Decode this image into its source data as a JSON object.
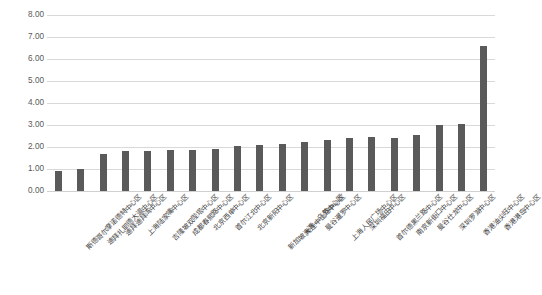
{
  "chart_data": {
    "type": "bar",
    "title": "",
    "subtitle": "",
    "xlabel": "",
    "ylabel": "",
    "ylim": [
      0,
      8
    ],
    "ytick_step": 1,
    "grid": true,
    "legend": "none",
    "bar_color": "#5a5a5a",
    "gridline_color": "#d9d9d9",
    "axis_text_color": "#595959",
    "ytick_labels": [
      "0.00",
      "1.00",
      "2.00",
      "3.00",
      "4.00",
      "5.00",
      "6.00",
      "7.00",
      "8.00"
    ],
    "categories": [
      "斯德哥尔摩诺德特中心区",
      "迪拜扎耶德大道中心区",
      "迪拜迪拜湾中心区",
      "上海陆家嘴中心区",
      "吉隆坡双陛塔中心区",
      "成都春熙路中心区",
      "北京西单中心区",
      "首尔江北中心区",
      "北京新阳中心区",
      "新加坡海湾—乌节中心区",
      "大连中山路中心区",
      "曼谷暹罗中心区",
      "上海人民广场中心区",
      "深圳福田中心区",
      "首尔德黑兰路中心区",
      "南京新街口中心区",
      "曼谷仕龙中心区",
      "深圳罗湖中心区",
      "香港油尖旺中心区",
      "香港港岛中心区"
    ],
    "values": [
      0.9,
      1.0,
      1.7,
      1.8,
      1.8,
      1.85,
      1.85,
      1.9,
      2.05,
      2.1,
      2.15,
      2.25,
      2.3,
      2.4,
      2.45,
      2.4,
      2.55,
      3.0,
      3.05,
      6.6
    ],
    "series": [
      {
        "name": "",
        "values": [
          0.9,
          1.0,
          1.7,
          1.8,
          1.8,
          1.85,
          1.85,
          1.9,
          2.05,
          2.1,
          2.15,
          2.25,
          2.3,
          2.4,
          2.45,
          2.4,
          2.55,
          3.0,
          3.05,
          6.6
        ]
      }
    ]
  }
}
